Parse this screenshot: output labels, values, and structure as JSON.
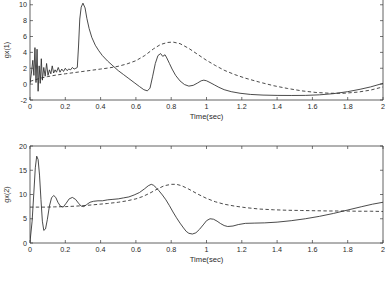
{
  "chart_data": [
    {
      "id": "top",
      "type": "line",
      "title": "",
      "xlabel": "Time(sec)",
      "ylabel": "gx(1)",
      "xlim": [
        0,
        2
      ],
      "ylim": [
        -2,
        10.6
      ],
      "xticks": [
        0,
        0.2,
        0.4,
        0.6,
        0.8,
        1,
        1.2,
        1.4,
        1.6,
        1.8,
        2
      ],
      "xticklabels": [
        "0",
        "0.2",
        "0.4",
        "0.6",
        "0.8",
        "1",
        "1.2",
        "1.4",
        "1.6",
        "1.8",
        "2"
      ],
      "yticks": [
        -2,
        0,
        2,
        4,
        6,
        8,
        10
      ],
      "yticklabels": [
        "-2",
        "0",
        "2",
        "4",
        "6",
        "8",
        "10"
      ],
      "grid": false,
      "legend": "none",
      "top_spine": false,
      "series": [
        {
          "name": "solid",
          "style": "solid",
          "x": [
            0,
            0.008,
            0.016,
            0.022,
            0.028,
            0.034,
            0.04,
            0.046,
            0.052,
            0.058,
            0.064,
            0.07,
            0.078,
            0.086,
            0.094,
            0.102,
            0.11,
            0.118,
            0.126,
            0.134,
            0.142,
            0.15,
            0.16,
            0.17,
            0.18,
            0.19,
            0.2,
            0.21,
            0.22,
            0.23,
            0.24,
            0.25,
            0.26,
            0.268,
            0.275,
            0.282,
            0.29,
            0.3,
            0.312,
            0.322,
            0.335,
            0.35,
            0.37,
            0.39,
            0.41,
            0.44,
            0.47,
            0.5,
            0.53,
            0.56,
            0.59,
            0.62,
            0.645,
            0.665,
            0.68,
            0.695,
            0.71,
            0.725,
            0.74,
            0.752,
            0.765,
            0.775,
            0.79,
            0.805,
            0.825,
            0.85,
            0.875,
            0.9,
            0.925,
            0.95,
            0.97,
            0.985,
            1.0,
            1.02,
            1.045,
            1.07,
            1.1,
            1.14,
            1.19,
            1.25,
            1.32,
            1.4,
            1.48,
            1.56,
            1.64,
            1.72,
            1.8,
            1.87,
            1.93,
            2.0
          ],
          "y": [
            0.1,
            1.4,
            3.0,
            1.1,
            4.6,
            0.2,
            4.4,
            -0.9,
            2.3,
            0.1,
            3.2,
            0.5,
            2.1,
            1.0,
            2.6,
            1.1,
            1.8,
            1.3,
            2.3,
            1.4,
            1.8,
            1.5,
            2.1,
            1.5,
            1.9,
            1.6,
            2.0,
            1.7,
            1.9,
            1.8,
            2.1,
            1.9,
            2.0,
            2.1,
            4.8,
            8.2,
            9.7,
            10.2,
            9.6,
            8.3,
            7.0,
            5.9,
            4.9,
            4.2,
            3.6,
            2.9,
            2.3,
            1.7,
            1.2,
            0.7,
            0.2,
            -0.3,
            -0.7,
            -0.85,
            -0.5,
            1.0,
            2.6,
            3.6,
            3.85,
            3.5,
            3.7,
            3.3,
            2.6,
            1.9,
            1.1,
            0.4,
            -0.05,
            -0.25,
            -0.15,
            0.15,
            0.42,
            0.5,
            0.42,
            0.2,
            -0.1,
            -0.4,
            -0.7,
            -0.95,
            -1.15,
            -1.3,
            -1.38,
            -1.42,
            -1.43,
            -1.42,
            -1.35,
            -1.2,
            -0.95,
            -0.65,
            -0.35,
            0.1
          ]
        },
        {
          "name": "dashed",
          "style": "dashed",
          "x": [
            0,
            0.03,
            0.06,
            0.1,
            0.15,
            0.2,
            0.25,
            0.3,
            0.35,
            0.4,
            0.45,
            0.5,
            0.55,
            0.6,
            0.65,
            0.7,
            0.74,
            0.78,
            0.81,
            0.85,
            0.9,
            0.95,
            1.0,
            1.05,
            1.1,
            1.16,
            1.22,
            1.3,
            1.38,
            1.46,
            1.54,
            1.62,
            1.7,
            1.78,
            1.86,
            1.93,
            2.0
          ],
          "y": [
            0.35,
            0.55,
            0.75,
            0.95,
            1.15,
            1.3,
            1.45,
            1.6,
            1.75,
            1.9,
            2.05,
            2.25,
            2.55,
            2.95,
            3.6,
            4.45,
            5.0,
            5.25,
            5.3,
            5.1,
            4.5,
            3.75,
            3.0,
            2.35,
            1.75,
            1.2,
            0.75,
            0.25,
            -0.2,
            -0.55,
            -0.85,
            -1.05,
            -1.15,
            -1.15,
            -1.0,
            -0.75,
            -0.35
          ]
        }
      ]
    },
    {
      "id": "bottom",
      "type": "line",
      "title": "",
      "xlabel": "Time(sec)",
      "ylabel": "gx(2)",
      "xlim": [
        0,
        2
      ],
      "ylim": [
        0,
        20
      ],
      "xticks": [
        0,
        0.2,
        0.4,
        0.6,
        0.8,
        1,
        1.2,
        1.4,
        1.6,
        1.8,
        2
      ],
      "xticklabels": [
        "0",
        "0.2",
        "0.4",
        "0.6",
        "0.8",
        "1",
        "1.2",
        "1.4",
        "1.6",
        "1.8",
        "2"
      ],
      "yticks": [
        0,
        5,
        10,
        15,
        20
      ],
      "yticklabels": [
        "0",
        "5",
        "10",
        "15",
        "20"
      ],
      "grid": false,
      "legend": "none",
      "top_spine": true,
      "series": [
        {
          "name": "solid",
          "style": "solid",
          "x": [
            0,
            0.012,
            0.022,
            0.03,
            0.038,
            0.046,
            0.054,
            0.062,
            0.07,
            0.078,
            0.088,
            0.098,
            0.11,
            0.122,
            0.134,
            0.146,
            0.158,
            0.172,
            0.188,
            0.205,
            0.222,
            0.24,
            0.258,
            0.275,
            0.29,
            0.305,
            0.32,
            0.34,
            0.36,
            0.385,
            0.41,
            0.44,
            0.47,
            0.5,
            0.53,
            0.56,
            0.59,
            0.62,
            0.65,
            0.67,
            0.687,
            0.7,
            0.715,
            0.73,
            0.75,
            0.77,
            0.79,
            0.81,
            0.83,
            0.85,
            0.87,
            0.885,
            0.9,
            0.92,
            0.94,
            0.96,
            0.985,
            1.0,
            1.02,
            1.04,
            1.06,
            1.08,
            1.1,
            1.12,
            1.15,
            1.18,
            1.22,
            1.27,
            1.33,
            1.4,
            1.48,
            1.56,
            1.64,
            1.72,
            1.8,
            1.88,
            1.94,
            2.0
          ],
          "y": [
            0.2,
            4.5,
            10.5,
            15.5,
            17.9,
            17.2,
            14.0,
            9.0,
            4.5,
            2.6,
            2.9,
            4.8,
            7.6,
            9.3,
            9.8,
            9.4,
            8.4,
            7.6,
            7.4,
            8.2,
            9.1,
            9.4,
            9.0,
            8.2,
            7.6,
            7.5,
            7.9,
            8.4,
            8.6,
            8.7,
            8.7,
            8.9,
            9.0,
            9.1,
            9.3,
            9.5,
            9.9,
            10.4,
            11.2,
            11.8,
            12.1,
            11.9,
            11.4,
            10.8,
            9.9,
            8.9,
            7.7,
            6.4,
            5.2,
            4.1,
            3.1,
            2.4,
            2.0,
            1.85,
            2.1,
            2.8,
            3.9,
            4.6,
            5.0,
            4.9,
            4.5,
            4.0,
            3.6,
            3.4,
            3.5,
            3.8,
            4.05,
            4.1,
            4.15,
            4.3,
            4.6,
            5.0,
            5.5,
            6.1,
            6.8,
            7.5,
            8.0,
            8.4
          ]
        },
        {
          "name": "dashed",
          "style": "dashed",
          "x": [
            0,
            0.02,
            0.05,
            0.09,
            0.14,
            0.2,
            0.26,
            0.32,
            0.38,
            0.44,
            0.5,
            0.55,
            0.6,
            0.64,
            0.68,
            0.72,
            0.76,
            0.8,
            0.83,
            0.86,
            0.9,
            0.95,
            1.0,
            1.05,
            1.1,
            1.16,
            1.22,
            1.3,
            1.38,
            1.46,
            1.54,
            1.62,
            1.7,
            1.78,
            1.86,
            1.93,
            2.0
          ],
          "y": [
            7.4,
            7.4,
            7.4,
            7.4,
            7.45,
            7.5,
            7.6,
            7.75,
            7.95,
            8.15,
            8.4,
            8.7,
            9.1,
            9.6,
            10.3,
            11.1,
            11.8,
            12.1,
            12.1,
            11.8,
            11.1,
            10.1,
            9.2,
            8.5,
            8.0,
            7.6,
            7.3,
            7.0,
            6.85,
            6.75,
            6.7,
            6.65,
            6.6,
            6.6,
            6.55,
            6.55,
            6.5
          ]
        }
      ]
    }
  ]
}
